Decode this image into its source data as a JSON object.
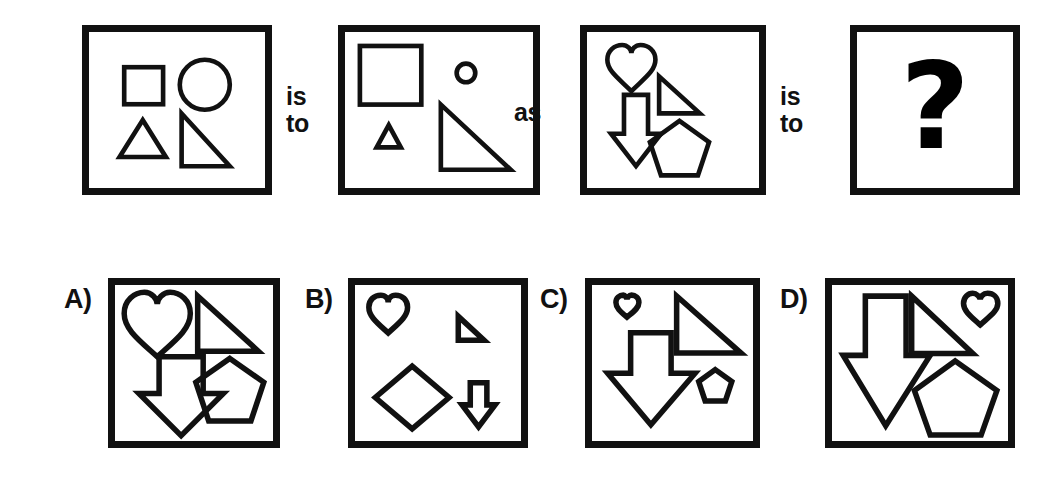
{
  "puzzle": {
    "type": "visual-analogy",
    "stem": {
      "panels": [
        {
          "id": "panel-a",
          "name": "first-term-panel",
          "shapes": [
            {
              "shape": "square",
              "size": "medium",
              "label": "square-medium"
            },
            {
              "shape": "circle",
              "size": "large",
              "label": "circle-large"
            },
            {
              "shape": "triangle",
              "size": "medium",
              "label": "triangle-medium"
            },
            {
              "shape": "right-triangle",
              "size": "medium",
              "label": "right-triangle-medium"
            }
          ]
        },
        {
          "id": "panel-b",
          "name": "second-term-panel",
          "shapes": [
            {
              "shape": "square",
              "size": "large",
              "label": "square-large"
            },
            {
              "shape": "circle",
              "size": "tiny",
              "label": "circle-tiny"
            },
            {
              "shape": "triangle",
              "size": "small",
              "label": "triangle-small"
            },
            {
              "shape": "right-triangle",
              "size": "large",
              "label": "right-triangle-large"
            }
          ]
        },
        {
          "id": "panel-c",
          "name": "third-term-panel",
          "shapes": [
            {
              "shape": "heart",
              "size": "medium",
              "label": "heart-medium"
            },
            {
              "shape": "right-triangle",
              "size": "medium",
              "label": "right-triangle-medium"
            },
            {
              "shape": "down-arrow",
              "size": "medium",
              "label": "down-arrow-medium"
            },
            {
              "shape": "pentagon",
              "size": "medium",
              "label": "pentagon-medium"
            }
          ]
        },
        {
          "id": "panel-d",
          "name": "answer-placeholder-panel",
          "glyph": "?"
        }
      ],
      "connectors": [
        {
          "id": "connector-1",
          "lines": [
            "is",
            "to"
          ]
        },
        {
          "id": "connector-2",
          "lines": [
            "as"
          ]
        },
        {
          "id": "connector-3",
          "lines": [
            "is",
            "to"
          ]
        }
      ]
    },
    "options": [
      {
        "id": "option-a",
        "label": "A)",
        "shapes": [
          {
            "shape": "heart",
            "size": "large",
            "label": "heart-large"
          },
          {
            "shape": "right-triangle",
            "size": "large",
            "label": "right-triangle-large"
          },
          {
            "shape": "down-arrow",
            "size": "large",
            "label": "down-arrow-large"
          },
          {
            "shape": "pentagon",
            "size": "large",
            "label": "pentagon-large"
          }
        ]
      },
      {
        "id": "option-b",
        "label": "B)",
        "shapes": [
          {
            "shape": "heart",
            "size": "small",
            "label": "heart-small"
          },
          {
            "shape": "right-triangle",
            "size": "small",
            "label": "right-triangle-small"
          },
          {
            "shape": "diamond",
            "size": "medium",
            "label": "diamond-medium"
          },
          {
            "shape": "down-arrow",
            "size": "small",
            "label": "down-arrow-small"
          }
        ]
      },
      {
        "id": "option-c",
        "label": "C)",
        "shapes": [
          {
            "shape": "heart",
            "size": "tiny",
            "label": "heart-tiny"
          },
          {
            "shape": "right-triangle",
            "size": "large",
            "label": "right-triangle-large"
          },
          {
            "shape": "down-arrow",
            "size": "large",
            "label": "down-arrow-large"
          },
          {
            "shape": "pentagon",
            "size": "small",
            "label": "pentagon-small"
          }
        ]
      },
      {
        "id": "option-d",
        "label": "D)",
        "shapes": [
          {
            "shape": "down-arrow",
            "size": "large",
            "label": "down-arrow-large"
          },
          {
            "shape": "right-triangle",
            "size": "large",
            "label": "right-triangle-large"
          },
          {
            "shape": "heart",
            "size": "small",
            "label": "heart-small"
          },
          {
            "shape": "pentagon",
            "size": "large",
            "label": "pentagon-large"
          }
        ]
      }
    ]
  },
  "style": {
    "ink": "#111111",
    "paper": "#ffffff",
    "stroke_width": 7
  }
}
